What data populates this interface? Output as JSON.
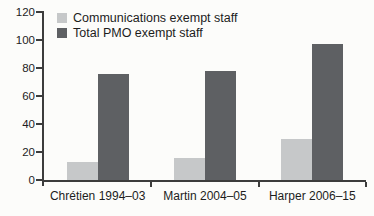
{
  "figure": {
    "background": "#fcfcfa",
    "axis_color": "#3c3c3c",
    "text_color": "#1d1d1d"
  },
  "chart_data": {
    "type": "bar",
    "title": "",
    "xlabel": "",
    "ylabel": "",
    "categories": [
      "Chrétien 1994–03",
      "Martin 2004–05",
      "Harper 2006–15"
    ],
    "series": [
      {
        "name": "Communications exempt staff",
        "color": "#c6c8c9",
        "values": [
          13,
          16,
          29
        ]
      },
      {
        "name": "Total PMO exempt staff",
        "color": "#5e6063",
        "values": [
          76,
          78,
          97
        ]
      }
    ],
    "ylim": [
      0,
      120
    ],
    "yticks": [
      0,
      20,
      40,
      60,
      80,
      100,
      120
    ],
    "grid": false,
    "legend_position": "top-left"
  }
}
